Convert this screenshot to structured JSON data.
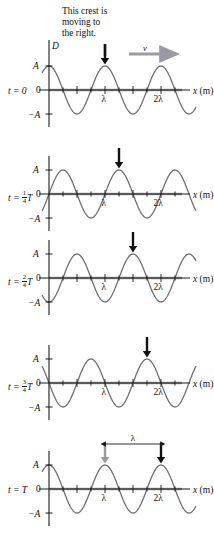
{
  "figure": {
    "caption": "This crest is\nmoving to\nthe right.",
    "velocity_symbol": "v",
    "y_axis_symbol": "D",
    "x_axis_label": "x (m)",
    "amp_pos_label": "A",
    "amp_neg_label": "−A",
    "zero_label": "0",
    "lambda_label": "λ",
    "two_lambda_label": "2λ",
    "shift_label": "λ",
    "colors": {
      "wave": "#6e6e76",
      "axis": "#1a1a1a",
      "arrow_black": "#111111",
      "arrow_gray": "#9a9aa0",
      "baseline_gray": "#9a9aa0",
      "text": "#111111"
    }
  },
  "panels": [
    {
      "id": "panel-t0",
      "time_prefix": "t = ",
      "time_value": "0",
      "time_fraction": null,
      "time_suffix": "",
      "phase_shift_fraction": 0,
      "crest_arrow_color": "#111111",
      "has_velocity_arrow": true,
      "has_shift_measure": false,
      "tick_labels": [
        "λ",
        "2λ"
      ],
      "amp_labels": [
        "A",
        "−A"
      ],
      "has_D_label": true
    },
    {
      "id": "panel-t-quarter",
      "time_prefix": "t = ",
      "time_value": "",
      "time_fraction": {
        "num": "1",
        "den": "4"
      },
      "time_suffix": "T",
      "phase_shift_fraction": 0.25,
      "crest_arrow_color": "#111111",
      "has_velocity_arrow": false,
      "has_shift_measure": false,
      "tick_labels": [
        "λ",
        "2λ"
      ],
      "amp_labels": [
        "A",
        "−A"
      ],
      "has_D_label": false
    },
    {
      "id": "panel-t-half",
      "time_prefix": "t = ",
      "time_value": "",
      "time_fraction": {
        "num": "2",
        "den": "4"
      },
      "time_suffix": "T",
      "phase_shift_fraction": 0.5,
      "crest_arrow_color": "#111111",
      "has_velocity_arrow": false,
      "has_shift_measure": false,
      "tick_labels": [
        "λ",
        "2λ"
      ],
      "amp_labels": [
        "A",
        "−A"
      ],
      "has_D_label": false
    },
    {
      "id": "panel-t-threequarter",
      "time_prefix": "t = ",
      "time_value": "",
      "time_fraction": {
        "num": "3",
        "den": "4"
      },
      "time_suffix": "T",
      "phase_shift_fraction": 0.75,
      "crest_arrow_color": "#111111",
      "has_velocity_arrow": false,
      "has_shift_measure": false,
      "tick_labels": [
        "λ",
        "2λ"
      ],
      "amp_labels": [
        "A",
        "−A"
      ],
      "has_D_label": false
    },
    {
      "id": "panel-t-full",
      "time_prefix": "t = ",
      "time_value": "T",
      "time_fraction": null,
      "time_suffix": "",
      "phase_shift_fraction": 1.0,
      "crest_arrow_color": "#111111",
      "has_velocity_arrow": false,
      "has_shift_measure": true,
      "tick_labels": [
        "λ",
        "2λ"
      ],
      "amp_labels": [
        "A",
        "−A"
      ],
      "has_D_label": false
    }
  ],
  "chart_data": {
    "type": "line",
    "xlabel": "x (m)",
    "ylabel": "D",
    "x_tick_labels": [
      "λ",
      "2λ"
    ],
    "y_tick_labels": [
      "A",
      "0",
      "−A"
    ],
    "ylim": [
      -1,
      1
    ],
    "xlim_in_wavelengths": [
      -0.12,
      2.62
    ],
    "grid": false,
    "legend": false,
    "waveform": "D(x,t) = A cos(2π(x/λ − t/T))",
    "series": [
      {
        "name": "t = 0",
        "phase_shift_wavelengths": 0.0,
        "crest_marker_x_wavelengths": 1.0
      },
      {
        "name": "t = 1/4 T",
        "phase_shift_wavelengths": 0.25,
        "crest_marker_x_wavelengths": 1.25
      },
      {
        "name": "t = 2/4 T",
        "phase_shift_wavelengths": 0.5,
        "crest_marker_x_wavelengths": 1.5
      },
      {
        "name": "t = 3/4 T",
        "phase_shift_wavelengths": 0.75,
        "crest_marker_x_wavelengths": 1.75
      },
      {
        "name": "t = T",
        "phase_shift_wavelengths": 1.0,
        "crest_marker_x_wavelengths": 2.0
      }
    ],
    "annotations": [
      {
        "text": "This crest is moving to the right.",
        "points_to": "crest at x = λ in the t = 0 panel"
      },
      {
        "text": "v",
        "type": "velocity-arrow",
        "direction": "right",
        "panel": "t = 0"
      },
      {
        "text": "λ",
        "type": "displacement-measure",
        "panel": "t = T",
        "from_x_wavelengths": 1.0,
        "to_x_wavelengths": 2.0
      }
    ]
  }
}
